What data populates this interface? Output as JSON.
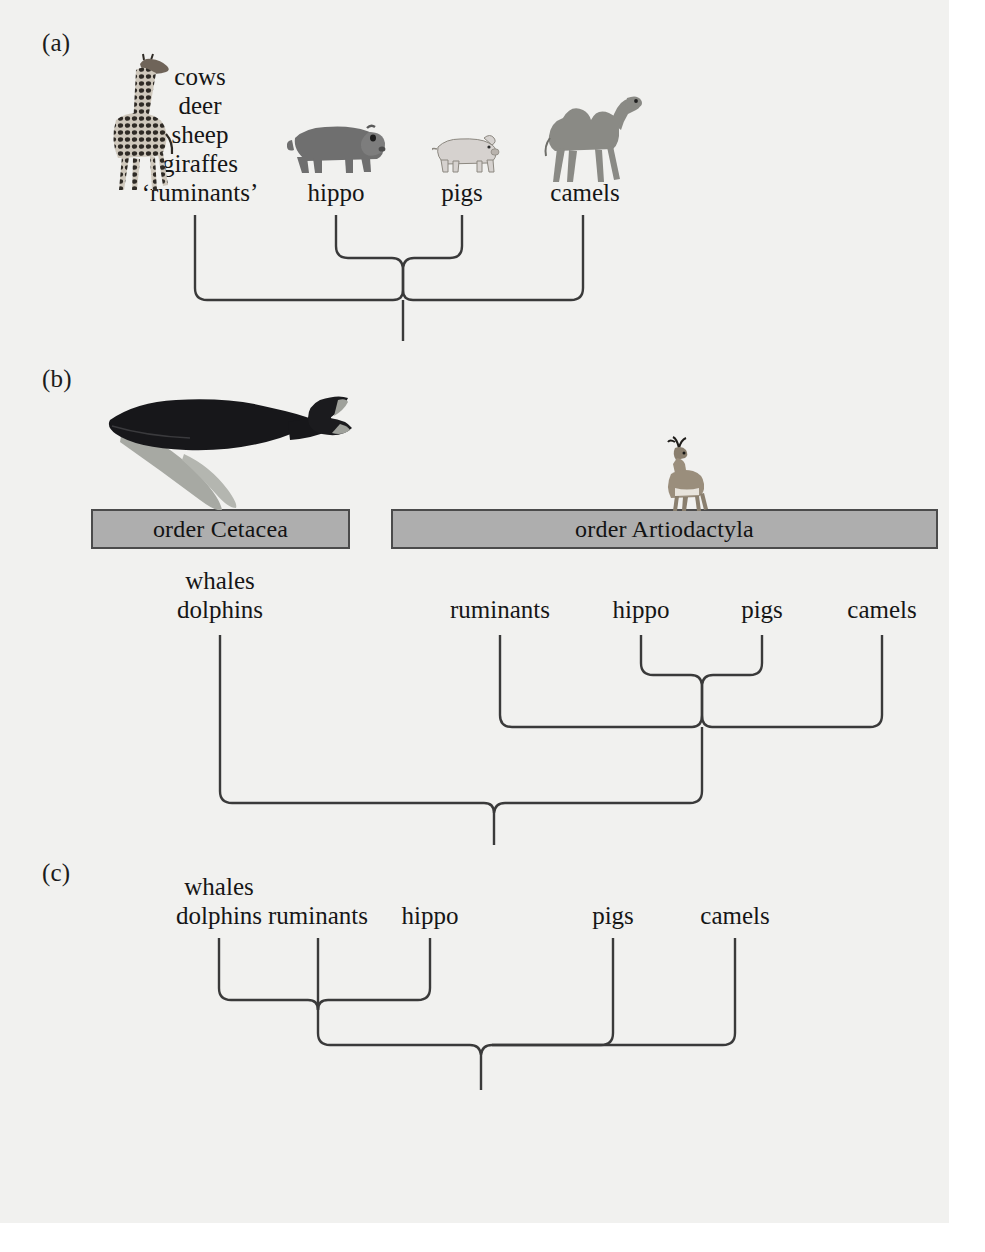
{
  "figure": {
    "background_color": "#f1f1ef",
    "line_color": "#3a3a3a",
    "box_fill_color": "#aeaeae",
    "box_border_color": "#4b4b4b",
    "text_color": "#161616"
  },
  "panels": [
    {
      "id": "a",
      "label": "(a)",
      "taxa": [
        {
          "name": "ruminants-group",
          "lines": [
            "cows",
            "deer",
            "sheep",
            "giraffes",
            "‘ruminants’"
          ],
          "x": 200
        },
        {
          "name": "hippo",
          "lines": [
            "hippo"
          ],
          "x": 336
        },
        {
          "name": "pigs",
          "lines": [
            "pigs"
          ],
          "x": 462
        },
        {
          "name": "camels",
          "lines": [
            "camels"
          ],
          "x": 585
        }
      ],
      "animal_icons": [
        "giraffe",
        "hippo",
        "pig",
        "camel"
      ],
      "topology": "((hippo,pigs),camels,ruminants)"
    },
    {
      "id": "b",
      "label": "(b)",
      "order_boxes": [
        {
          "name": "order-cetacea-box",
          "label": "order Cetacea",
          "x": 91,
          "y": 509,
          "width": 259,
          "height": 40
        },
        {
          "name": "order-artiodactyla-box",
          "label": "order Artiodactyla",
          "x": 391,
          "y": 509,
          "width": 547,
          "height": 40
        }
      ],
      "taxa": [
        {
          "name": "whales-dolphins",
          "lines": [
            "whales",
            "dolphins"
          ],
          "x": 220
        },
        {
          "name": "ruminants",
          "lines": [
            "ruminants"
          ],
          "x": 500
        },
        {
          "name": "hippo",
          "lines": [
            "hippo"
          ],
          "x": 641
        },
        {
          "name": "pigs",
          "lines": [
            "pigs"
          ],
          "x": 762
        },
        {
          "name": "camels",
          "lines": [
            "camels"
          ],
          "x": 882
        }
      ],
      "animal_icons": [
        "humpback-whale",
        "pronghorn"
      ],
      "topology": "(whales+dolphins,(ruminants,((hippo,pigs),camels)))"
    },
    {
      "id": "c",
      "label": "(c)",
      "taxa": [
        {
          "name": "whales-dolphins",
          "lines": [
            "whales",
            "dolphins"
          ],
          "x": 219
        },
        {
          "name": "ruminants",
          "lines": [
            "ruminants"
          ],
          "x": 318
        },
        {
          "name": "hippo",
          "lines": [
            "hippo"
          ],
          "x": 430
        },
        {
          "name": "pigs",
          "lines": [
            "pigs"
          ],
          "x": 613
        },
        {
          "name": "camels",
          "lines": [
            "camels"
          ],
          "x": 735
        }
      ],
      "animal_icons": [],
      "topology": "(((whales+dolphins,ruminants,hippo),pigs,camels))"
    }
  ]
}
